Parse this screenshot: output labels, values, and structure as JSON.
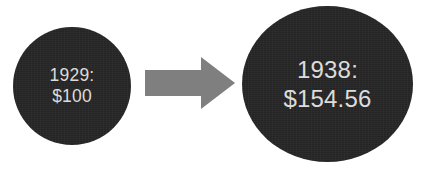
{
  "canvas": {
    "width": 425,
    "height": 171,
    "background_color": "#FFFFFF"
  },
  "palette": {
    "bubble_fill": "#262626",
    "bubble_text": "#DCDCDC",
    "arrow_fill": "#7F7F7F"
  },
  "diagram": {
    "type": "before-after-comparison",
    "start": {
      "year_label": "1929:",
      "amount_label": "$100",
      "shape": "circle",
      "fill_color": "#262626",
      "text_color": "#DCDCDC"
    },
    "connector": {
      "icon": "right-arrow-icon",
      "direction": "right",
      "fill_color": "#7F7F7F"
    },
    "end": {
      "year_label": "1938:",
      "amount_label": "$154.56",
      "shape": "circle",
      "fill_color": "#262626",
      "text_color": "#DCDCDC"
    }
  }
}
